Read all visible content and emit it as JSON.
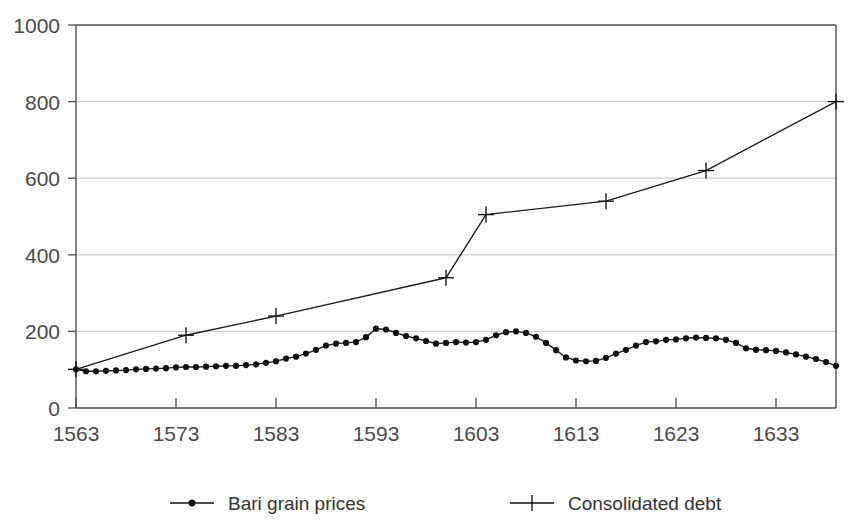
{
  "figure": {
    "title": "",
    "title_visible": false
  },
  "legend": {
    "position": "bottom-center",
    "entries": [
      {
        "label": "Bari grain prices",
        "marker": "dot-line-marker",
        "color": "#111111"
      },
      {
        "label": "Consolidated debt",
        "marker": "plus-line-marker",
        "color": "#111111"
      }
    ]
  },
  "axes": {
    "y_ticks": [
      "0",
      "200",
      "400",
      "600",
      "800",
      "1000"
    ],
    "x_ticks": [
      "1563",
      "1573",
      "1583",
      "1593",
      "1603",
      "1613",
      "1623",
      "1633"
    ]
  },
  "chart_data": {
    "type": "line",
    "title": "",
    "xlabel": "",
    "ylabel": "",
    "xlim": [
      1563,
      1639
    ],
    "ylim": [
      0,
      1000
    ],
    "grid": true,
    "grid_axis": "y",
    "legend_position": "bottom-center",
    "x_tick_values": [
      1563,
      1573,
      1583,
      1593,
      1603,
      1613,
      1623,
      1633
    ],
    "y_tick_values": [
      0,
      200,
      400,
      600,
      800,
      1000
    ],
    "series": [
      {
        "name": "Bari grain prices",
        "marker": "dot",
        "points": [
          [
            1563,
            101
          ],
          [
            1564,
            96
          ],
          [
            1565,
            96
          ],
          [
            1566,
            97
          ],
          [
            1567,
            98
          ],
          [
            1568,
            99
          ],
          [
            1569,
            101
          ],
          [
            1570,
            102
          ],
          [
            1571,
            103
          ],
          [
            1572,
            104
          ],
          [
            1573,
            106
          ],
          [
            1574,
            107
          ],
          [
            1575,
            107
          ],
          [
            1576,
            108
          ],
          [
            1577,
            109
          ],
          [
            1578,
            110
          ],
          [
            1579,
            110
          ],
          [
            1580,
            112
          ],
          [
            1581,
            114
          ],
          [
            1582,
            118
          ],
          [
            1583,
            122
          ],
          [
            1584,
            129
          ],
          [
            1585,
            134
          ],
          [
            1586,
            142
          ],
          [
            1587,
            152
          ],
          [
            1588,
            163
          ],
          [
            1589,
            168
          ],
          [
            1590,
            170
          ],
          [
            1591,
            172
          ],
          [
            1592,
            185
          ],
          [
            1593,
            207
          ],
          [
            1594,
            205
          ],
          [
            1595,
            196
          ],
          [
            1596,
            188
          ],
          [
            1597,
            182
          ],
          [
            1598,
            175
          ],
          [
            1599,
            168
          ],
          [
            1600,
            170
          ],
          [
            1601,
            172
          ],
          [
            1602,
            171
          ],
          [
            1603,
            172
          ],
          [
            1604,
            178
          ],
          [
            1605,
            190
          ],
          [
            1606,
            198
          ],
          [
            1607,
            200
          ],
          [
            1608,
            196
          ],
          [
            1609,
            186
          ],
          [
            1610,
            170
          ],
          [
            1611,
            151
          ],
          [
            1612,
            132
          ],
          [
            1613,
            124
          ],
          [
            1614,
            122
          ],
          [
            1615,
            123
          ],
          [
            1616,
            131
          ],
          [
            1617,
            142
          ],
          [
            1618,
            152
          ],
          [
            1619,
            163
          ],
          [
            1620,
            172
          ],
          [
            1621,
            174
          ],
          [
            1622,
            178
          ],
          [
            1623,
            179
          ],
          [
            1624,
            182
          ],
          [
            1625,
            184
          ],
          [
            1626,
            183
          ],
          [
            1627,
            182
          ],
          [
            1628,
            178
          ],
          [
            1629,
            170
          ],
          [
            1630,
            156
          ],
          [
            1631,
            152
          ],
          [
            1632,
            151
          ],
          [
            1633,
            149
          ],
          [
            1634,
            145
          ],
          [
            1635,
            140
          ],
          [
            1636,
            134
          ],
          [
            1637,
            128
          ],
          [
            1638,
            120
          ],
          [
            1639,
            110
          ]
        ]
      },
      {
        "name": "Consolidated debt",
        "marker": "plus",
        "points": [
          [
            1563,
            101
          ],
          [
            1574,
            190
          ],
          [
            1583,
            240
          ],
          [
            1600,
            340
          ],
          [
            1604,
            505
          ],
          [
            1616,
            540
          ],
          [
            1626,
            620
          ],
          [
            1639,
            800
          ]
        ]
      }
    ]
  }
}
